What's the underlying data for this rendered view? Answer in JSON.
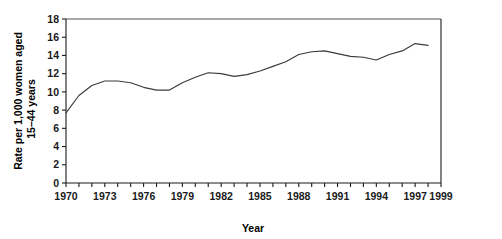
{
  "chart_data": {
    "type": "line",
    "title": "",
    "xlabel": "Year",
    "ylabel": "Rate per 1,000 women aged 15–44 years",
    "ylabel_line1": "Rate per 1,000 women aged",
    "ylabel_line2": "15–44 years",
    "xlim": [
      1970,
      1999
    ],
    "ylim": [
      0,
      18
    ],
    "y_ticks": [
      0,
      2,
      4,
      6,
      8,
      10,
      12,
      14,
      16,
      18
    ],
    "y_tick_labels": [
      "0",
      "2",
      "4",
      "6",
      "8",
      "10",
      "12",
      "14",
      "16",
      "18"
    ],
    "x_ticks": [
      1970,
      1971,
      1972,
      1973,
      1974,
      1975,
      1976,
      1977,
      1978,
      1979,
      1980,
      1981,
      1982,
      1983,
      1984,
      1985,
      1986,
      1987,
      1988,
      1989,
      1990,
      1991,
      1992,
      1993,
      1994,
      1995,
      1996,
      1997,
      1998,
      1999
    ],
    "x_tick_labels": [
      {
        "value": 1970,
        "label": "1970"
      },
      {
        "value": 1973,
        "label": "1973"
      },
      {
        "value": 1976,
        "label": "1976"
      },
      {
        "value": 1979,
        "label": "1979"
      },
      {
        "value": 1982,
        "label": "1982"
      },
      {
        "value": 1985,
        "label": "1985"
      },
      {
        "value": 1988,
        "label": "1988"
      },
      {
        "value": 1991,
        "label": "1991"
      },
      {
        "value": 1994,
        "label": "1994"
      },
      {
        "value": 1997,
        "label": "1997"
      },
      {
        "value": 1999,
        "label": "1999"
      }
    ],
    "grid": false,
    "legend": null,
    "x": [
      1970,
      1971,
      1972,
      1973,
      1974,
      1975,
      1976,
      1977,
      1978,
      1979,
      1980,
      1981,
      1982,
      1983,
      1984,
      1985,
      1986,
      1987,
      1988,
      1989,
      1990,
      1991,
      1992,
      1993,
      1994,
      1995,
      1996,
      1997,
      1998
    ],
    "values": [
      7.7,
      9.6,
      10.7,
      11.2,
      11.2,
      11.0,
      10.5,
      10.2,
      10.2,
      11.0,
      11.6,
      12.1,
      12.0,
      11.7,
      11.9,
      12.3,
      12.8,
      13.3,
      14.1,
      14.4,
      14.5,
      14.2,
      13.9,
      13.8,
      13.5,
      14.1,
      14.5,
      15.3,
      15.1
    ],
    "series_color": "#3b3b3b",
    "axis_color": "#1a1a1a",
    "frame_color": "#555555",
    "background": "#ffffff",
    "plot_area": {
      "left": 66,
      "right": 441,
      "top": 19,
      "bottom": 183
    }
  }
}
